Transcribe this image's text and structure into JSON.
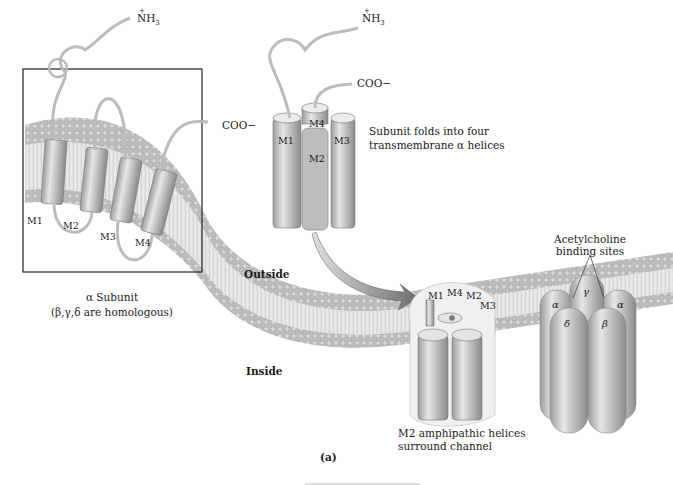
{
  "figure": {
    "panel_label": "(a)",
    "subunit_panel": {
      "n_terminus": "NH3",
      "n_terminus_charge": "+",
      "c_terminus": "COO−",
      "helices": [
        "M1",
        "M2",
        "M3",
        "M4"
      ],
      "caption_line1": "α Subunit",
      "caption_line2": "(β,γ,δ are homologous)"
    },
    "folded_subunit": {
      "n_terminus": "NH3",
      "n_terminus_charge": "+",
      "c_terminus": "COO−",
      "helices": [
        "M1",
        "M4",
        "M2",
        "M3"
      ],
      "caption_line1": "Subunit folds into four",
      "caption_line2": "transmembrane α helices"
    },
    "membrane": {
      "outside_label": "Outside",
      "inside_label": "Inside"
    },
    "channel_assembly": {
      "helix_labels": [
        "M1",
        "M4",
        "M2",
        "M3"
      ],
      "caption_line1": "M2 amphipathic helices",
      "caption_line2": "surround channel"
    },
    "receptor": {
      "binding_label_line1": "Acetylcholine",
      "binding_label_line2": "binding sites",
      "subunits": {
        "gamma": "γ",
        "alpha_left": "α",
        "alpha_right": "α",
        "delta": "δ",
        "beta": "β"
      }
    }
  }
}
